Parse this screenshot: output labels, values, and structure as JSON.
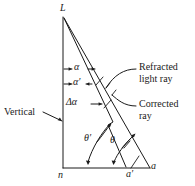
{
  "figure": {
    "stroke_color": "#1a1a1a",
    "background_color": "#ffffff",
    "points": {
      "apex": "L",
      "base_left": "n",
      "base_mid": "a′",
      "base_right": "a"
    },
    "angles": {
      "alpha": "α",
      "alpha_prime": "α′",
      "delta_alpha": "Δα",
      "theta_prime": "θ′",
      "theta": "θ"
    },
    "annotations": {
      "vertical": "Vertical",
      "refracted_line1": "Refracted",
      "refracted_line2": "light ray",
      "corrected_line1": "Corrected",
      "corrected_line2": "ray"
    }
  }
}
